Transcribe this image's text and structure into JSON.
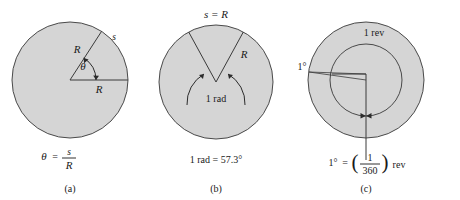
{
  "figure": {
    "background_color": "#ffffff",
    "disk_fill_color": "#d5d5d5",
    "disk_stroke_color": "#4a4a4a",
    "text_color": "#1a1a1a"
  },
  "panels": [
    {
      "id": "a",
      "caption": "(a)",
      "labels": {
        "radius_slant": "R",
        "radius_horizontal": "R",
        "arc_length": "s",
        "angle": "θ"
      },
      "equation": {
        "lhs": "θ",
        "equals": "=",
        "numerator": "s",
        "denominator": "R",
        "plain": "θ = s/R"
      }
    },
    {
      "id": "b",
      "caption": "(b)",
      "labels": {
        "arc_equals_radius": "s = R",
        "radius": "R",
        "angle": "1 rad"
      },
      "equation": {
        "plain": "1 rad = 57.3°"
      }
    },
    {
      "id": "c",
      "caption": "(c)",
      "labels": {
        "revolution": "1 rev",
        "degree": "1°"
      },
      "equation": {
        "lhs": "1°",
        "equals": "=",
        "paren_open": "(",
        "numerator": "1",
        "denominator": "360",
        "paren_close": ")",
        "unit": "rev",
        "plain": "1° = (1/360) rev"
      }
    }
  ]
}
